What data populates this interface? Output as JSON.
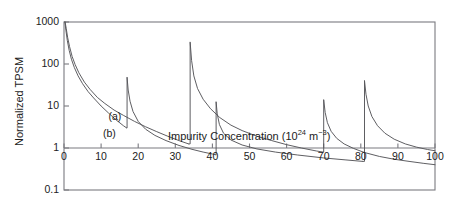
{
  "figure": {
    "background_color": "#ffffff",
    "line_color": "#55555a",
    "axis_color": "#7a7a80",
    "text_color": "#1c1c1c"
  },
  "axes": {
    "y_axis_title": "Normalized TPSM",
    "x_axis_title_main": "Impurity Concentration (10",
    "x_axis_title_exp1": "24",
    "x_axis_title_mid": " m",
    "x_axis_title_exp2": "−3",
    "x_axis_title_end": ")",
    "x_ticks": [
      "0",
      "10",
      "20",
      "30",
      "40",
      "50",
      "60",
      "70",
      "80",
      "90",
      "100"
    ],
    "y_ticks": [
      "1000",
      "100",
      "10",
      "1",
      "0.1"
    ]
  },
  "annotations": {
    "curve_a": "(a)",
    "curve_b": "(b)"
  },
  "chart_data": {
    "type": "line",
    "title": "",
    "subtitle": "",
    "xlabel": "Impurity Concentration (10^24 m^-3)",
    "ylabel": "Normalized TPSM",
    "xlim": [
      0,
      100
    ],
    "ylim": [
      0.1,
      1000
    ],
    "yscale": "log",
    "xscale": "linear",
    "grid": false,
    "legend_position": "inline-annotations",
    "xticks": [
      0,
      10,
      20,
      30,
      40,
      50,
      60,
      70,
      80,
      90,
      100
    ],
    "yticks": [
      0.1,
      1,
      10,
      100,
      1000
    ],
    "resonance_positions": [
      17,
      34,
      41,
      70,
      81
    ],
    "series": [
      {
        "name": "(a)",
        "label_position": {
          "x": 12,
          "y": 5.5
        },
        "comment": "upper decaying branch, resets at resonances 34, 70",
        "segments": [
          {
            "x": [
              0.3,
              0.6,
              1.0,
              1.5,
              2.2,
              3.0,
              4.0,
              5.5,
              7.0,
              9.0,
              11.0,
              13.5,
              16.0,
              19.0,
              22.0,
              25.0,
              28.0,
              31.0,
              33.6
            ],
            "y": [
              1000,
              700,
              420,
              260,
              150,
              97,
              62,
              37,
              25,
              16,
              11.5,
              8.0,
              6.0,
              4.3,
              3.2,
              2.45,
              1.9,
              1.5,
              1.25
            ]
          },
          {
            "x": [
              34.0,
              34.4,
              35.0,
              36.0,
              37.5,
              39.5,
              42.0,
              45.0,
              48.0,
              52.0,
              56.0,
              60.0,
              64.0,
              68.0,
              69.8
            ],
            "y": [
              330,
              120,
              52,
              26,
              14.5,
              8.6,
              5.3,
              3.5,
              2.6,
              1.9,
              1.5,
              1.2,
              1.0,
              0.85,
              0.8
            ]
          },
          {
            "x": [
              70.0,
              70.4,
              71.0,
              72.0,
              73.5,
              75.5,
              78.0,
              81.0,
              85.0,
              89.0,
              93.0,
              97.0,
              100.0
            ],
            "y": [
              14,
              7.0,
              4.0,
              2.5,
              1.7,
              1.25,
              0.98,
              0.78,
              0.63,
              0.54,
              0.48,
              0.43,
              0.4
            ]
          }
        ]
      },
      {
        "name": "(b)",
        "label_position": {
          "x": 10.5,
          "y": 2.1
        },
        "comment": "lower decaying branch, resets at resonances 17, 41, 81",
        "segments": [
          {
            "x": [
              0.25,
              0.5,
              0.9,
              1.4,
              2.0,
              2.8,
              3.8,
              5.0,
              6.5,
              8.0,
              10.0,
              12.0,
              14.0,
              16.0,
              16.9
            ],
            "y": [
              1000,
              640,
              360,
              210,
              130,
              82,
              52,
              34,
              22,
              15.5,
              10.0,
              6.8,
              4.7,
              3.4,
              3.0
            ]
          },
          {
            "x": [
              17.0,
              17.3,
              17.8,
              18.6,
              20.0,
              22.0,
              24.5,
              27.5,
              31.0,
              34.5,
              37.5,
              40.0,
              40.9
            ],
            "y": [
              48,
              24,
              13.0,
              7.4,
              4.3,
              2.8,
              2.0,
              1.5,
              1.15,
              0.93,
              0.8,
              0.72,
              0.69
            ]
          },
          {
            "x": [
              41.0,
              41.3,
              41.9,
              43.0,
              45.0,
              48.0,
              52.0,
              57.0,
              63.0,
              70.0,
              76.0,
              80.5
            ],
            "y": [
              12.5,
              6.5,
              3.6,
              2.25,
              1.55,
              1.18,
              0.95,
              0.8,
              0.68,
              0.58,
              0.52,
              0.48
            ]
          },
          {
            "x": [
              81.0,
              81.4,
              82.0,
              83.0,
              84.5,
              86.5,
              89.0,
              92.0,
              95.0,
              98.0,
              100.0
            ],
            "y": [
              40,
              19,
              10.0,
              5.6,
              3.4,
              2.25,
              1.62,
              1.25,
              1.05,
              0.92,
              0.86
            ]
          }
        ]
      }
    ]
  }
}
